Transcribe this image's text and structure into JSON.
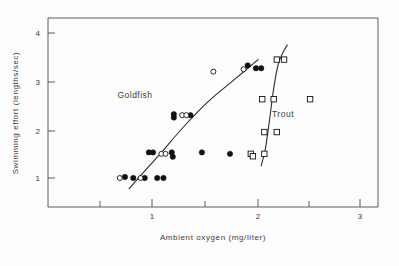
{
  "chart_data": {
    "type": "scatter",
    "title": "",
    "xlabel": "Ambient  oxygen  (mg/liter)",
    "ylabel": "Swimming effort  (lengths/sec)",
    "xlim": [
      0.2,
      3.2
    ],
    "ylim": [
      0.45,
      4.35
    ],
    "xticks": [
      1,
      2,
      3
    ],
    "xtick_labels": [
      "1",
      "2",
      "3"
    ],
    "xminor_ticks": [
      0.5,
      1.5,
      2.5
    ],
    "yticks": [
      1,
      2,
      3,
      4
    ],
    "ytick_labels": [
      "1",
      "2",
      "3",
      "4"
    ],
    "grid": false,
    "legend": "inline-annotations",
    "annotations": [
      {
        "text": "Goldfish",
        "x": 1.05,
        "y": 2.62
      },
      {
        "text": "Trout",
        "x": 2.3,
        "y": 2.18
      }
    ],
    "series": [
      {
        "name": "Goldfish (filled circles)",
        "marker": "filled-circle",
        "color": "#111111",
        "points": [
          {
            "x": 0.74,
            "y": 1.02
          },
          {
            "x": 0.82,
            "y": 1.0
          },
          {
            "x": 0.93,
            "y": 1.0
          },
          {
            "x": 1.05,
            "y": 1.0
          },
          {
            "x": 1.11,
            "y": 1.0
          },
          {
            "x": 0.97,
            "y": 1.53
          },
          {
            "x": 1.01,
            "y": 1.53
          },
          {
            "x": 1.19,
            "y": 1.53
          },
          {
            "x": 1.2,
            "y": 1.44
          },
          {
            "x": 1.48,
            "y": 1.53
          },
          {
            "x": 1.75,
            "y": 1.5
          },
          {
            "x": 1.21,
            "y": 2.32
          },
          {
            "x": 1.21,
            "y": 2.25
          },
          {
            "x": 1.37,
            "y": 2.3
          },
          {
            "x": 1.92,
            "y": 3.33
          },
          {
            "x": 2.0,
            "y": 3.27
          },
          {
            "x": 2.05,
            "y": 3.27
          }
        ]
      },
      {
        "name": "Goldfish (open circles)",
        "marker": "open-circle",
        "color": "#111111",
        "points": [
          {
            "x": 0.69,
            "y": 1.0
          },
          {
            "x": 0.89,
            "y": 1.0
          },
          {
            "x": 1.09,
            "y": 1.5
          },
          {
            "x": 1.13,
            "y": 1.5
          },
          {
            "x": 1.29,
            "y": 2.3
          },
          {
            "x": 1.33,
            "y": 2.3
          },
          {
            "x": 1.59,
            "y": 3.2
          },
          {
            "x": 1.88,
            "y": 3.25
          }
        ]
      },
      {
        "name": "Trout (open squares)",
        "marker": "open-square",
        "color": "#111111",
        "points": [
          {
            "x": 1.95,
            "y": 1.5
          },
          {
            "x": 1.97,
            "y": 1.45
          },
          {
            "x": 2.08,
            "y": 1.5
          },
          {
            "x": 2.08,
            "y": 1.95
          },
          {
            "x": 2.2,
            "y": 1.95
          },
          {
            "x": 2.06,
            "y": 2.63
          },
          {
            "x": 2.17,
            "y": 2.63
          },
          {
            "x": 2.52,
            "y": 2.63
          },
          {
            "x": 2.2,
            "y": 3.45
          },
          {
            "x": 2.27,
            "y": 3.45
          }
        ]
      }
    ],
    "fit_curves": [
      {
        "name": "goldfish-fit",
        "path_points": [
          {
            "x": 0.78,
            "y": 0.78
          },
          {
            "x": 0.92,
            "y": 1.12
          },
          {
            "x": 1.1,
            "y": 1.55
          },
          {
            "x": 1.3,
            "y": 2.05
          },
          {
            "x": 1.55,
            "y": 2.6
          },
          {
            "x": 1.8,
            "y": 3.05
          },
          {
            "x": 2.02,
            "y": 3.45
          }
        ]
      },
      {
        "name": "trout-fit",
        "path_points": [
          {
            "x": 2.05,
            "y": 1.25
          },
          {
            "x": 2.09,
            "y": 1.6
          },
          {
            "x": 2.13,
            "y": 2.2
          },
          {
            "x": 2.17,
            "y": 2.85
          },
          {
            "x": 2.22,
            "y": 3.4
          },
          {
            "x": 2.3,
            "y": 3.75
          }
        ]
      }
    ]
  },
  "axes": {
    "x_axis_title": "Ambient  oxygen  (mg/liter)",
    "y_axis_title": "Swimming effort  (lengths/sec)",
    "x_tick_1": "1",
    "x_tick_2": "2",
    "x_tick_3": "3",
    "y_tick_1": "1",
    "y_tick_2": "2",
    "y_tick_3": "3",
    "y_tick_4": "4"
  },
  "labels": {
    "goldfish": "Goldfish",
    "trout": "Trout"
  }
}
